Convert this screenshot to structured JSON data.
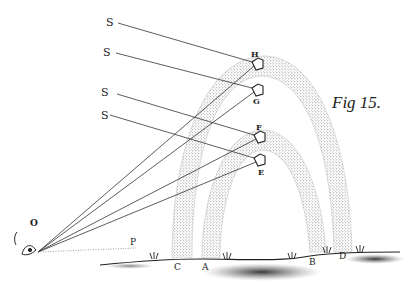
{
  "figure": {
    "caption": "Fig 15.",
    "colors": {
      "ink": "#222222",
      "stipple": "#8a8a8a",
      "paper": "#ffffff"
    }
  },
  "labels": {
    "sun_rays": [
      "S",
      "S",
      "S",
      "S"
    ],
    "drops": {
      "H": "H",
      "G": "G",
      "F": "F",
      "E": "E"
    },
    "eye": "O",
    "horizon_point": "P",
    "feet": {
      "C": "C",
      "A": "A",
      "B": "B",
      "D": "D"
    }
  }
}
